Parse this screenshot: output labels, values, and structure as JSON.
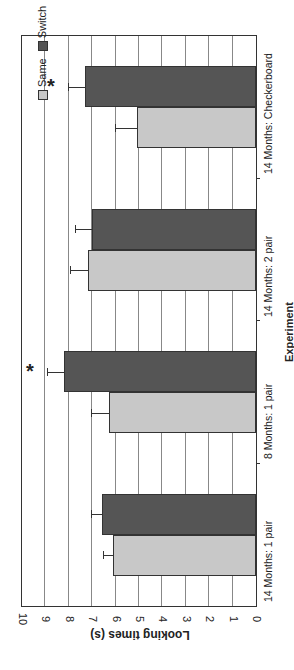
{
  "chart_data": {
    "type": "bar",
    "orientation": "rotated 90deg (vertical bars drawn sideways)",
    "title": "",
    "xlabel": "Experiment",
    "ylabel": "Looking times (s)",
    "ylim": [
      0,
      10
    ],
    "yticks": [
      "0",
      "1",
      "2",
      "3",
      "4",
      "5",
      "6",
      "7",
      "8",
      "9",
      "10"
    ],
    "categories": [
      "14 Months: 1 pair",
      "8 Months: 1 pair",
      "14 Months: 2 pair",
      "14 Months: Checkerboard"
    ],
    "series": [
      {
        "name": "Same",
        "color": "#c8c8c8",
        "values": [
          6.1,
          6.3,
          7.2,
          5.1
        ],
        "errors": [
          0.4,
          0.7,
          0.7,
          0.9
        ]
      },
      {
        "name": "Switch",
        "color": "#555555",
        "values": [
          6.6,
          8.2,
          7.0,
          7.3
        ],
        "errors": [
          0.4,
          0.7,
          0.7,
          0.7
        ]
      }
    ],
    "annotations": [
      {
        "category": "8 Months: 1 pair",
        "text": "*"
      },
      {
        "category": "14 Months: Checkerboard",
        "text": "*"
      }
    ],
    "grid": true,
    "legend_position": "top-right inside plot"
  },
  "legend": {
    "same": "Same",
    "switch": "Switch"
  },
  "axis": {
    "ylabel": "Looking times (s)",
    "xlabel": "Experiment"
  },
  "star": "*"
}
